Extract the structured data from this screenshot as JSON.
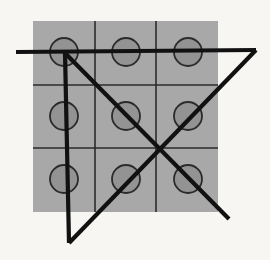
{
  "figure": {
    "canvas": {
      "width": 270,
      "height": 260,
      "background": "#f7f6f3"
    },
    "grid_panel": {
      "name": "gray-grid-panel",
      "x": 33,
      "y": 21,
      "width": 185,
      "height": 191,
      "fill": "#a8a8a8",
      "rows": 3,
      "cols": 3,
      "line_color": "#2b2b2b",
      "line_width": 1.6,
      "vertical_lines_x": [
        95,
        156
      ],
      "horizontal_lines_y": [
        85,
        148
      ]
    },
    "circles": {
      "name": "grid-circles",
      "count": 9,
      "radius": 14,
      "fill": "#8f8f8f",
      "stroke": "#2b2b2b",
      "stroke_width": 1.8,
      "centers": [
        {
          "cx": 64,
          "cy": 52,
          "label": "circle-r1c1"
        },
        {
          "cx": 126,
          "cy": 52,
          "label": "circle-r1c2"
        },
        {
          "cx": 188,
          "cy": 52,
          "label": "circle-r1c3"
        },
        {
          "cx": 64,
          "cy": 116,
          "label": "circle-r2c1"
        },
        {
          "cx": 126,
          "cy": 116,
          "label": "circle-r2c2"
        },
        {
          "cx": 188,
          "cy": 116,
          "label": "circle-r2c3"
        },
        {
          "cx": 64,
          "cy": 179,
          "label": "circle-r3c1"
        },
        {
          "cx": 126,
          "cy": 179,
          "label": "circle-r3c2"
        },
        {
          "cx": 188,
          "cy": 179,
          "label": "circle-r3c3"
        }
      ]
    },
    "overlay_strokes": {
      "name": "thick-line-overlay",
      "color": "#111111",
      "width": 4.2,
      "segments": [
        {
          "label": "horizontal-top-line",
          "x1": 16,
          "y1": 52,
          "x2": 256,
          "y2": 50
        },
        {
          "label": "vertical-left-line",
          "x1": 65,
          "y1": 52,
          "x2": 69,
          "y2": 243
        },
        {
          "label": "diagonal-down-right",
          "x1": 64,
          "y1": 52,
          "x2": 229,
          "y2": 219
        },
        {
          "label": "diagonal-down-left",
          "x1": 256,
          "y1": 50,
          "x2": 69,
          "y2": 243
        }
      ],
      "crossing_point": {
        "x": 157,
        "y": 148
      }
    }
  }
}
